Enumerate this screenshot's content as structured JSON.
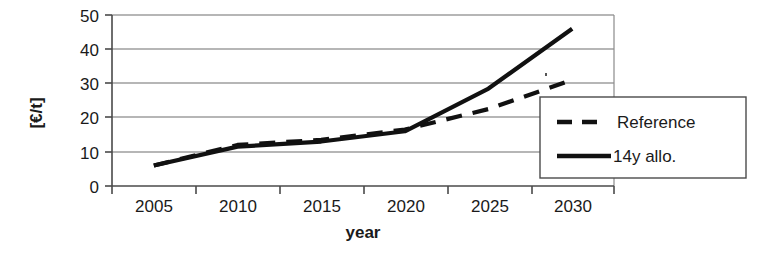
{
  "chart_data": {
    "type": "line",
    "title": "",
    "xlabel": "year",
    "ylabel": "[€/t]",
    "categories": [
      "2005",
      "2010",
      "2015",
      "2020",
      "2025",
      "2030"
    ],
    "x": [
      2005,
      2010,
      2015,
      2020,
      2025,
      2030
    ],
    "xlim": [
      2005,
      2030
    ],
    "ylim": [
      0,
      50
    ],
    "yticks": [
      "0",
      "10",
      "20",
      "30",
      "40",
      "50"
    ],
    "ytick_values": [
      0,
      10,
      20,
      30,
      40,
      50
    ],
    "grid": "horizontal",
    "legend_position": "bottom-right-inside",
    "series": [
      {
        "name": "Reference",
        "style": "dashed",
        "color": "#111111",
        "values": [
          6,
          12,
          13.5,
          16.5,
          22.5,
          31
        ]
      },
      {
        "name": "14y allo.",
        "style": "solid",
        "color": "#111111",
        "values": [
          6,
          11.5,
          13,
          16,
          28.5,
          46
        ]
      }
    ],
    "legend": [
      {
        "label": "Reference",
        "style": "dashed"
      },
      {
        "label": "14y allo.",
        "style": "solid"
      }
    ]
  },
  "axes": {
    "y_title": "[€/t]",
    "x_title": "year",
    "y_ticks": [
      "50",
      "40",
      "30",
      "20",
      "10",
      "0"
    ],
    "x_ticks": [
      "2005",
      "2010",
      "2015",
      "2020",
      "2025",
      "2030"
    ]
  },
  "legend": {
    "items": [
      {
        "label": "Reference"
      },
      {
        "label": "14y allo."
      }
    ]
  },
  "colors": {
    "line": "#111111",
    "grid": "#777777",
    "axis": "#555555",
    "background": "#ffffff"
  }
}
